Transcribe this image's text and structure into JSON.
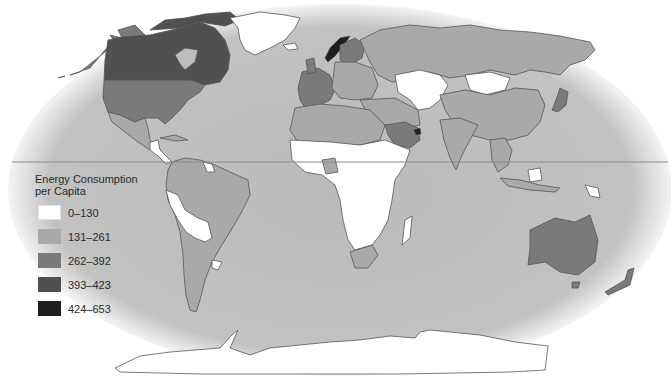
{
  "map": {
    "title": "Energy Consumption per Capita",
    "projection": "elliptical world map",
    "colors": {
      "ocean": "#bdbdbd",
      "ocean_edge": "#d8d8d8",
      "background": "#ffffff",
      "border": "#555555",
      "equator_line": "#8a8a8a"
    },
    "legend": {
      "title_line1": "Energy Consumption",
      "title_line2": "per Capita",
      "items": [
        {
          "label": "0–130",
          "color": "#ffffff"
        },
        {
          "label": "131–261",
          "color": "#a9a9a9"
        },
        {
          "label": "262–392",
          "color": "#7a7a7a"
        },
        {
          "label": "393–423",
          "color": "#505050"
        },
        {
          "label": "424–653",
          "color": "#1e1e1e"
        }
      ]
    },
    "regions": [
      {
        "name": "Canada",
        "class": "393–423"
      },
      {
        "name": "Alaska / United States",
        "class": "262–392"
      },
      {
        "name": "Greenland",
        "class": "0–130"
      },
      {
        "name": "Mexico",
        "class": "131–261"
      },
      {
        "name": "Central America",
        "class": "0–130"
      },
      {
        "name": "South America (most)",
        "class": "131–261"
      },
      {
        "name": "Peru / Bolivia / Paraguay / Guianas",
        "class": "0–130"
      },
      {
        "name": "Norway",
        "class": "424–653"
      },
      {
        "name": "Western Europe",
        "class": "262–392"
      },
      {
        "name": "Eastern Europe",
        "class": "131–261"
      },
      {
        "name": "Russia",
        "class": "131–261"
      },
      {
        "name": "Kazakhstan / Central Asia / Mongolia",
        "class": "0–130"
      },
      {
        "name": "China",
        "class": "131–261"
      },
      {
        "name": "Japan",
        "class": "262–392"
      },
      {
        "name": "India",
        "class": "131–261"
      },
      {
        "name": "Saudi Arabia",
        "class": "262–392"
      },
      {
        "name": "UAE",
        "class": "424–653"
      },
      {
        "name": "North Africa",
        "class": "131–261"
      },
      {
        "name": "Sub-Saharan Africa",
        "class": "0–130"
      },
      {
        "name": "South Africa",
        "class": "131–261"
      },
      {
        "name": "Australia",
        "class": "262–392"
      },
      {
        "name": "New Zealand",
        "class": "262–392"
      },
      {
        "name": "Antarctica",
        "class": "0–130"
      }
    ]
  }
}
